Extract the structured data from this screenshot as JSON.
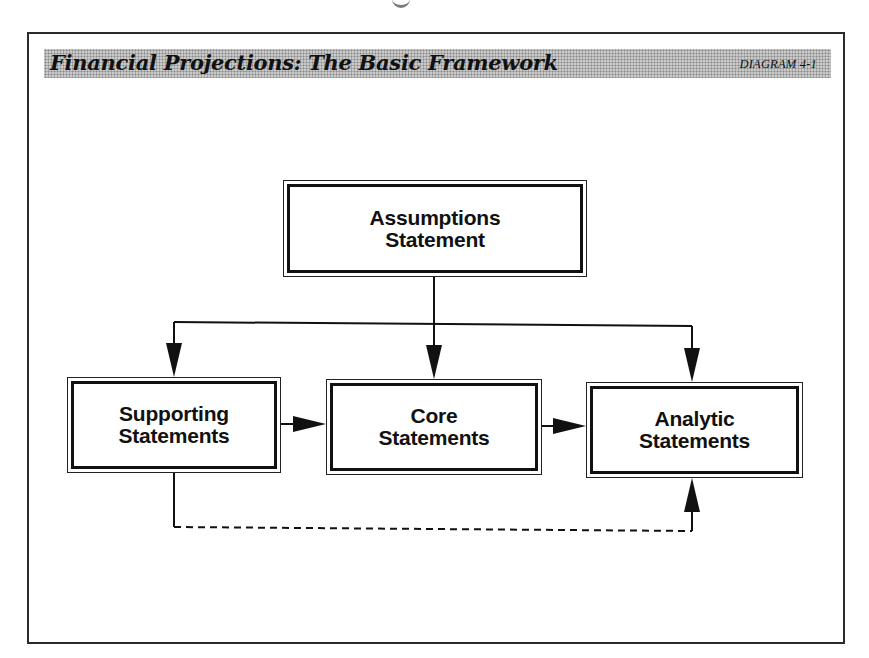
{
  "header": {
    "title": "Financial Projections: The Basic Framework",
    "tag": "DIAGRAM 4-1"
  },
  "nodes": [
    {
      "id": "assumptions",
      "label": "Assumptions\nStatement"
    },
    {
      "id": "supporting",
      "label": "Supporting\nStatements"
    },
    {
      "id": "core",
      "label": "Core\nStatements"
    },
    {
      "id": "analytic",
      "label": "Analytic\nStatements"
    }
  ],
  "edges": [
    {
      "from": "assumptions",
      "to": "supporting",
      "style": "solid"
    },
    {
      "from": "assumptions",
      "to": "core",
      "style": "solid"
    },
    {
      "from": "assumptions",
      "to": "analytic",
      "style": "solid"
    },
    {
      "from": "supporting",
      "to": "core",
      "style": "solid"
    },
    {
      "from": "core",
      "to": "analytic",
      "style": "solid"
    },
    {
      "from": "supporting",
      "to": "analytic",
      "style": "dashed"
    }
  ],
  "colors": {
    "ink": "#111111",
    "band": "#c9c9c9"
  }
}
